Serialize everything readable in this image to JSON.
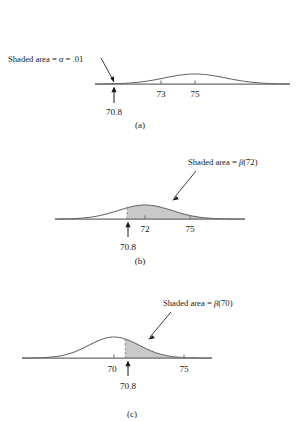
{
  "figure": {
    "type": "statistical-normal-curves",
    "panel_count": 3,
    "shade_color": "#c9c9c9",
    "curve_color": "#6b6b6b",
    "text_color": "#1a1a1a"
  },
  "panels": [
    {
      "id": "a",
      "caption": "(a)",
      "annotation": {
        "prefix": "Shaded area = ",
        "symbol": "α",
        "middle": " = ",
        "value": ".01",
        "full": "Shaded area = α = .01"
      },
      "axis_ticks": [
        {
          "label": "73",
          "value": 73
        },
        {
          "label": "75",
          "value": 75
        }
      ],
      "marker": {
        "label": "70.8",
        "value": 70.8
      },
      "curve": {
        "mean": 75,
        "sd": 1.8
      },
      "shaded_region": {
        "from": "-inf",
        "to": 70.8,
        "area": 0.01
      }
    },
    {
      "id": "b",
      "caption": "(b)",
      "annotation": {
        "prefix": "Shaded area = ",
        "symbol": "β",
        "argument": "(72)",
        "full": "Shaded area = β(72)"
      },
      "axis_ticks": [
        {
          "label": "72",
          "value": 72
        },
        {
          "label": "75",
          "value": 75
        }
      ],
      "marker": {
        "label": "70.8",
        "value": 70.8
      },
      "curve": {
        "mean": 72,
        "sd": 1.8
      },
      "shaded_region": {
        "from": 70.8,
        "to": "+inf",
        "area_name": "β(72)"
      }
    },
    {
      "id": "c",
      "caption": "(c)",
      "annotation": {
        "prefix": "Shaded area = ",
        "symbol": "β",
        "argument": "(70)",
        "full": "Shaded area = β(70)"
      },
      "axis_ticks": [
        {
          "label": "70",
          "value": 70
        },
        {
          "label": "75",
          "value": 75
        }
      ],
      "marker": {
        "label": "70.8",
        "value": 70.8
      },
      "curve": {
        "mean": 70,
        "sd": 1.8
      },
      "shaded_region": {
        "from": 70.8,
        "to": "+inf",
        "area_name": "β(70)"
      }
    }
  ],
  "chart_data": {
    "type": "area",
    "title": "",
    "xlabel": "",
    "ylabel": "",
    "grid": false,
    "legend": null,
    "subplots": [
      {
        "panel": "a",
        "caption": "(a)",
        "distribution": "normal",
        "mean": 75,
        "sd": 1.8,
        "x_tick_labels": [
          "73",
          "75"
        ],
        "x_tick_values": [
          73,
          75
        ],
        "marker_label": "70.8",
        "marker_value": 70.8,
        "shaded": {
          "direction": "left-tail",
          "cutoff": 70.8,
          "area": 0.01
        },
        "annotation": "Shaded area = α = .01"
      },
      {
        "panel": "b",
        "caption": "(b)",
        "distribution": "normal",
        "mean": 72,
        "sd": 1.8,
        "x_tick_labels": [
          "72",
          "75"
        ],
        "x_tick_values": [
          72,
          75
        ],
        "marker_label": "70.8",
        "marker_value": 70.8,
        "shaded": {
          "direction": "right-tail",
          "cutoff": 70.8,
          "area_label": "β(72)"
        },
        "annotation": "Shaded area = β(72)"
      },
      {
        "panel": "c",
        "caption": "(c)",
        "distribution": "normal",
        "mean": 70,
        "sd": 1.8,
        "x_tick_labels": [
          "70",
          "75"
        ],
        "x_tick_values": [
          70,
          75
        ],
        "marker_label": "70.8",
        "marker_value": 70.8,
        "shaded": {
          "direction": "right-tail",
          "cutoff": 70.8,
          "area_label": "β(70)"
        },
        "annotation": "Shaded area = β(70)"
      }
    ]
  }
}
